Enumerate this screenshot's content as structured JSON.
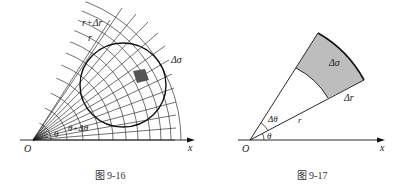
{
  "figures": [
    {
      "id": "fig-9-16",
      "caption": "图 9-16",
      "labels": {
        "origin": "O",
        "x_axis": "x",
        "r_outer": "r+Δr",
        "r_inner": "r",
        "area_element": "Δσ",
        "theta": "θ",
        "theta_plus": "θ+Δθ"
      }
    },
    {
      "id": "fig-9-17",
      "caption": "图 9-17",
      "labels": {
        "origin": "O",
        "x_axis": "x",
        "area_element": "Δσ",
        "delta_r": "Δr",
        "radius": "r",
        "delta_theta": "Δθ",
        "theta": "θ"
      }
    }
  ],
  "colors": {
    "line": "#222222",
    "shade_small": "#555555",
    "shade_sector": "#bdbdbd"
  }
}
